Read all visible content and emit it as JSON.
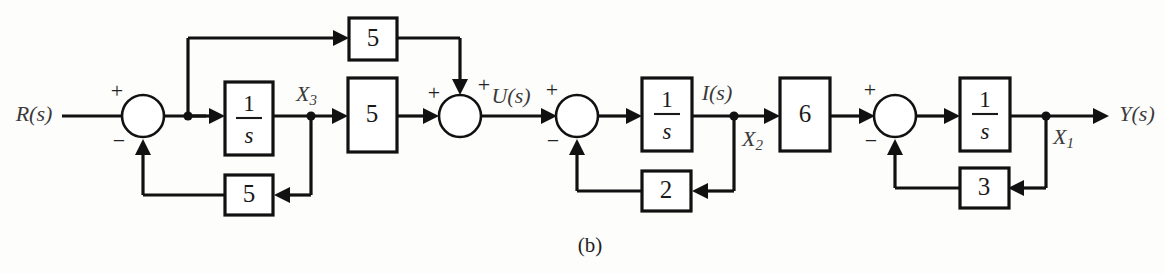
{
  "figure": {
    "caption": "(b)",
    "type": "control-system-block-diagram",
    "background_color": "#fdfdfc",
    "line_color": "#111111"
  },
  "signals": {
    "input": "R(s)",
    "output": "Y(s)",
    "x3": "X",
    "x3_sub": "3",
    "u": "U(s)",
    "i": "I(s)",
    "x2": "X",
    "x2_sub": "2",
    "x1": "X",
    "x1_sub": "1"
  },
  "blocks": [
    {
      "id": "gain-top-5",
      "label": "5",
      "kind": "gain"
    },
    {
      "id": "integrator-1",
      "label": "1/s",
      "numerator": "1",
      "denominator": "s",
      "kind": "integrator"
    },
    {
      "id": "gain-forward-5",
      "label": "5",
      "kind": "gain"
    },
    {
      "id": "gain-feedback-5",
      "label": "5",
      "kind": "gain"
    },
    {
      "id": "integrator-2",
      "label": "1/s",
      "numerator": "1",
      "denominator": "s",
      "kind": "integrator"
    },
    {
      "id": "gain-feedback-2",
      "label": "2",
      "kind": "gain"
    },
    {
      "id": "gain-6",
      "label": "6",
      "kind": "gain"
    },
    {
      "id": "integrator-3",
      "label": "1/s",
      "numerator": "1",
      "denominator": "s",
      "kind": "integrator"
    },
    {
      "id": "gain-feedback-3",
      "label": "3",
      "kind": "gain"
    }
  ],
  "summing_junctions": [
    {
      "id": "sum-1",
      "signs": [
        "+",
        "-"
      ]
    },
    {
      "id": "sum-2",
      "signs": [
        "+",
        "+"
      ]
    },
    {
      "id": "sum-3",
      "signs": [
        "+",
        "-"
      ]
    },
    {
      "id": "sum-4",
      "signs": [
        "+",
        "-"
      ]
    }
  ],
  "signs": {
    "plus": "+",
    "minus": "−"
  }
}
